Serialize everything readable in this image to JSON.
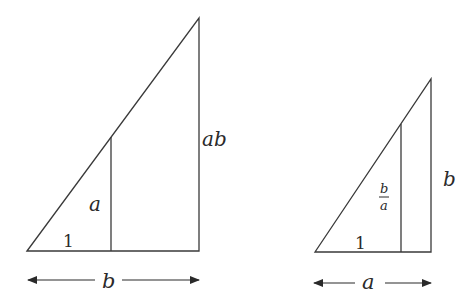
{
  "diagram": {
    "stroke_color": "#3a3a3a",
    "left_triangle": {
      "labels": {
        "base_small": "1",
        "inner_height": "a",
        "outer_height": "ab",
        "width": "b"
      }
    },
    "right_triangle": {
      "labels": {
        "base_small": "1",
        "inner_height_num": "b",
        "inner_height_den": "a",
        "outer_height": "b",
        "width": "a"
      }
    }
  }
}
